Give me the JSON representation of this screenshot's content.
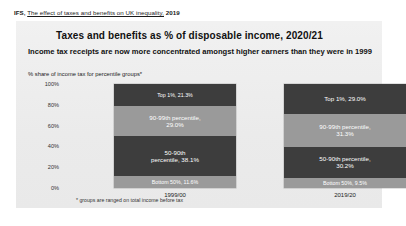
{
  "citation": {
    "source": "IFS,",
    "link_text": "The effect of taxes and benefits on UK inequality,",
    "year": "2019"
  },
  "slide": {
    "title": "Taxes and benefits as % of disposable income, 2020/21",
    "subtitle": "Income tax receipts are now more concentrated amongst higher earners than they were in 1999",
    "axis_caption": "% share of income tax for percentile groups*",
    "footnote": "* groups are ranged on total income before tax"
  },
  "chart_data": {
    "type": "bar",
    "title": "% share of income tax for percentile groups*",
    "subtitle": "Income tax receipts are now more concentrated amongst higher earners than they were in 1999",
    "xlabel": "",
    "ylabel": "% share of income tax for percentile groups*",
    "ylim": [
      0,
      100
    ],
    "yticks": [
      "0%",
      "20%",
      "40%",
      "60%",
      "80%",
      "100%"
    ],
    "grid": false,
    "legend": "none",
    "stacked": true,
    "categories": [
      "1999/00",
      "2019/20"
    ],
    "series": [
      {
        "name": "Top 1%",
        "values": [
          21.3,
          29.0
        ],
        "labels": [
          "Top 1%, 21.3%",
          "Top 1%, 29.0%"
        ],
        "color": "#3d3d3d",
        "shade": "dark"
      },
      {
        "name": "90-99th percentile",
        "values": [
          29.0,
          31.3
        ],
        "labels": [
          "90-99th percentile,\n29.0%",
          "90-99th percentile,\n31.3%"
        ],
        "color": "#9a9a9a",
        "shade": "light"
      },
      {
        "name": "50-90th percentile",
        "values": [
          38.1,
          30.2
        ],
        "labels": [
          "50-90th\npercentile, 38.1%",
          "50-90th percentile,\n30.2%"
        ],
        "color": "#3d3d3d",
        "shade": "dark"
      },
      {
        "name": "Bottom 50%",
        "values": [
          11.6,
          9.5
        ],
        "labels": [
          "Bottom 50%, 11.6%",
          "Bottom 50%, 9.5%"
        ],
        "color": "#9a9a9a",
        "shade": "light"
      }
    ],
    "annotations": [
      "* groups are ranged on total income before tax"
    ]
  },
  "colors": {
    "dark_segment": "#3d3d3d",
    "light_segment": "#9a9a9a",
    "panel_background": "#eeeeee",
    "page_background": "#ffffff"
  }
}
